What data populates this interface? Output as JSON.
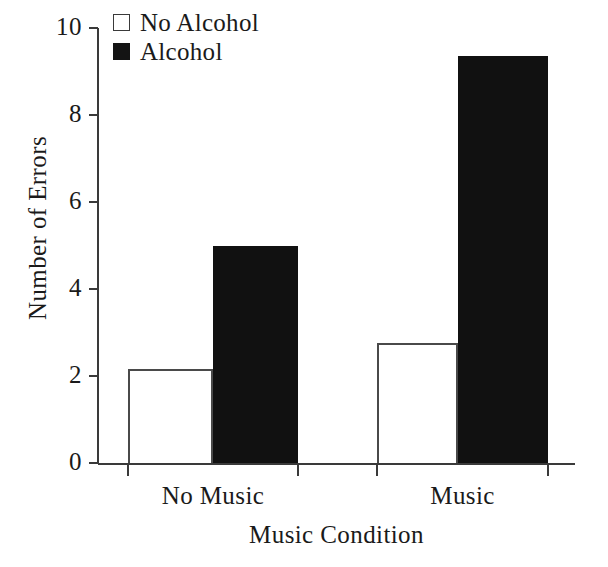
{
  "chart_data": {
    "type": "bar",
    "title": "",
    "subtitle": "",
    "xlabel": "Music Condition",
    "ylabel": "Number of Errors",
    "categories": [
      "No Music",
      "Music"
    ],
    "series": [
      {
        "name": "No Alcohol",
        "style": "open",
        "values": [
          2.15,
          2.75
        ]
      },
      {
        "name": "Alcohol",
        "style": "filled",
        "values": [
          5.0,
          9.35
        ]
      }
    ],
    "ylim": [
      0,
      10
    ],
    "ytick_values": [
      0,
      2,
      4,
      6,
      8,
      10
    ],
    "ytick_labels": [
      "0",
      "2",
      "4",
      "6",
      "8",
      "10"
    ],
    "grid": false,
    "legend_position": "top-left",
    "legend_entries": [
      {
        "label": "No Alcohol",
        "swatch": "open-square",
        "color": "#ffffff"
      },
      {
        "label": "Alcohol",
        "swatch": "filled-square",
        "color": "#141414"
      }
    ],
    "colors": {
      "no_alcohol_fill": "#ffffff",
      "no_alcohol_edge": "#4a4a4a",
      "alcohol_fill": "#111111",
      "axis": "#3a3a3a",
      "text": "#1a1a1a",
      "background": "#ffffff"
    }
  }
}
